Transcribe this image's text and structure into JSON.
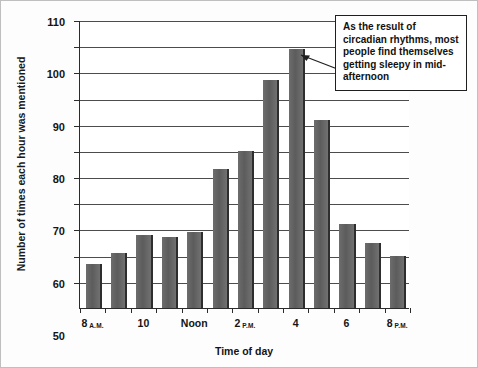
{
  "chart_data": {
    "type": "bar",
    "title": "",
    "xlabel": "Time of day",
    "ylabel": "Number of times each hour was mentioned",
    "ylim": [
      0,
      110
    ],
    "ytick_step": 10,
    "grid": true,
    "legend": null,
    "bar_color": "#5c5c5c",
    "bar_shadow_color": "#2e2e2e",
    "categories": [
      "8 A.M.",
      "9 A.M.",
      "10 A.M.",
      "11 A.M.",
      "Noon",
      "1 P.M.",
      "2 P.M.",
      "3 P.M.",
      "4 P.M.",
      "5 P.M.",
      "6 P.M.",
      "7 P.M.",
      "8 P.M."
    ],
    "values": [
      17,
      21,
      28,
      27,
      29,
      53,
      60,
      87,
      99,
      72,
      32,
      25,
      20
    ],
    "ytick_labels": [
      "10",
      "20",
      "30",
      "40",
      "50",
      "60",
      "70",
      "80",
      "90",
      "100",
      "110"
    ],
    "ytick_values": [
      10,
      20,
      30,
      40,
      50,
      60,
      70,
      80,
      90,
      100,
      110
    ],
    "xtick_labels": [
      {
        "main": "8",
        "sub": "A.M.",
        "category_index": 0
      },
      {
        "main": "10",
        "sub": "",
        "category_index": 2
      },
      {
        "main": "Noon",
        "sub": "",
        "category_index": 4
      },
      {
        "main": "2",
        "sub": "P.M.",
        "category_index": 6
      },
      {
        "main": "4",
        "sub": "",
        "category_index": 8
      },
      {
        "main": "6",
        "sub": "",
        "category_index": 10
      },
      {
        "main": "8",
        "sub": "P.M.",
        "category_index": 12
      }
    ],
    "annotations": [
      {
        "text": "As the result of circadian rhythms, most people find themselves getting sleepy in mid-afternoon",
        "points_to_category": "4 P.M.",
        "points_to_value": 99
      }
    ]
  }
}
